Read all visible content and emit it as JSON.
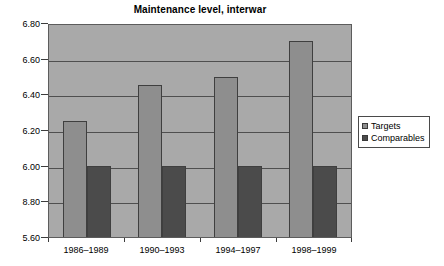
{
  "chart_data": {
    "type": "bar",
    "title": "Maintenance level, interwar",
    "xlabel": "",
    "ylabel": "",
    "categories": [
      "1986–1989",
      "1990–1993",
      "1994–1997",
      "1998–1999"
    ],
    "series": [
      {
        "name": "Targets",
        "color": "#8e8e8e",
        "values": [
          6.25,
          6.45,
          6.5,
          6.7
        ]
      },
      {
        "name": "Comparables",
        "color": "#4b4b4b",
        "values": [
          6.0,
          6.0,
          6.0,
          6.0
        ]
      }
    ],
    "ylim": [
      5.6,
      6.8
    ],
    "yticks": [
      "6.80",
      "6.60",
      "6.40",
      "6.20",
      "6.00",
      "8.80",
      "5.60"
    ],
    "ytick_values": [
      6.8,
      6.6,
      6.4,
      6.2,
      6.0,
      5.8,
      5.6
    ],
    "grid": true,
    "legend_position": "right",
    "plot_background": "#a9a9a9",
    "page_background": "#ffffff"
  },
  "legend": {
    "items": [
      {
        "label": "Targets"
      },
      {
        "label": "Comparables"
      }
    ]
  }
}
